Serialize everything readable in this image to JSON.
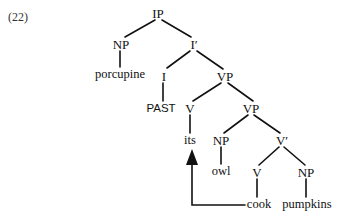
{
  "example_number": "(22)",
  "colors": {
    "line": "#111111",
    "text": "#111111",
    "background": "#ffffff"
  },
  "nodes": {
    "ip": "IP",
    "np_subject": "NP",
    "subject_word": "porcupine",
    "i_bar": "I′",
    "i_head": "I",
    "tense": "PAST",
    "vp_upper": "VP",
    "v_upper": "V",
    "v_upper_word": "its",
    "vp_lower": "VP",
    "np_object1": "NP",
    "object1_word": "owl",
    "v_bar": "V′",
    "v_lower": "V",
    "v_lower_word": "cook",
    "np_object2": "NP",
    "object2_word": "pumpkins"
  },
  "movement_arrow": {
    "from": "cook",
    "to": "its",
    "icon": "arrow-up-icon"
  }
}
